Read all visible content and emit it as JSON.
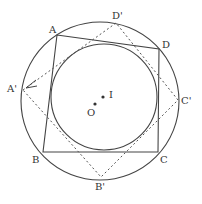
{
  "diagram": {
    "title": "",
    "colors": {
      "stroke": "#444444",
      "background": "#ffffff"
    },
    "circumcircle": {
      "center": [
        100,
        101
      ],
      "r": 79
    },
    "incircle": {
      "center": [
        104,
        97
      ],
      "r": 53
    },
    "quadrilateral": {
      "vertices": {
        "A": [
          57,
          35
        ],
        "D": [
          159,
          49
        ],
        "C": [
          158,
          152
        ],
        "B": [
          43,
          152
        ]
      }
    },
    "dashed_quadrilateral": {
      "vertices": {
        "A'": [
          23,
          90
        ],
        "D'": [
          116,
          23
        ],
        "C'": [
          178,
          100
        ],
        "B'": [
          101,
          177
        ]
      }
    },
    "points": {
      "O": [
        95,
        104
      ],
      "I": [
        103,
        97
      ]
    },
    "labels": {
      "A": "A",
      "B": "B",
      "C": "C",
      "D": "D",
      "A_prime": "A'",
      "B_prime": "B'",
      "C_prime": "C'",
      "D_prime": "D'",
      "O": "O",
      "I": "I"
    }
  }
}
